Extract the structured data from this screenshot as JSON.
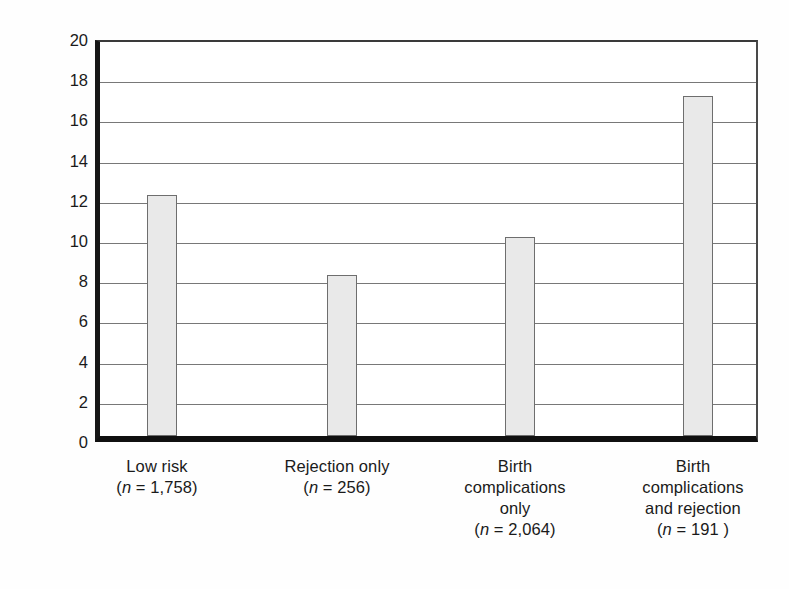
{
  "chart_data": {
    "type": "bar",
    "title": "",
    "subtitle": "",
    "xlabel": "",
    "ylabel": "Percent violent",
    "ylim": [
      0,
      20
    ],
    "ytick_step": 2,
    "yticks": [
      20,
      18,
      16,
      14,
      12,
      10,
      8,
      6,
      4,
      2,
      0
    ],
    "ytick_labels": [
      "20",
      "18",
      "16",
      "14",
      "12",
      "10",
      "8",
      "6",
      "4",
      "2",
      "0"
    ],
    "grid": "horizontal",
    "legend": "none",
    "categories": [
      "Low risk",
      "Rejection only",
      "Birth complications only",
      "Birth complications and rejection"
    ],
    "values": [
      12.0,
      8.0,
      9.9,
      16.9
    ],
    "group_sizes": [
      1758,
      256,
      2064,
      191
    ],
    "bar_color": "#e9e9e9",
    "bar_border_color": "#6e6e6e",
    "axis_color": "#101010",
    "gridline_color": "#787878",
    "background_color": "#ffffff"
  },
  "axis": {
    "y_title": "Percent violent",
    "ticks": [
      {
        "value": 20,
        "label": "20"
      },
      {
        "value": 18,
        "label": "18"
      },
      {
        "value": 16,
        "label": "16"
      },
      {
        "value": 14,
        "label": "14"
      },
      {
        "value": 12,
        "label": "12"
      },
      {
        "value": 10,
        "label": "10"
      },
      {
        "value": 8,
        "label": "8"
      },
      {
        "value": 6,
        "label": "6"
      },
      {
        "value": 4,
        "label": "4"
      },
      {
        "value": 2,
        "label": "2"
      },
      {
        "value": 0,
        "label": "0"
      }
    ]
  },
  "categories": [
    {
      "lines": [
        "Low risk"
      ],
      "n_prefix": "(",
      "n_italic": "n",
      "n_value": " = 1,758)",
      "value": 12.0
    },
    {
      "lines": [
        "Rejection only"
      ],
      "n_prefix": "(",
      "n_italic": "n",
      "n_value": " = 256)",
      "value": 8.0
    },
    {
      "lines": [
        "Birth",
        "complications",
        "only"
      ],
      "n_prefix": "(",
      "n_italic": "n",
      "n_value": " = 2,064)",
      "value": 9.9
    },
    {
      "lines": [
        "Birth",
        "complications",
        "and rejection"
      ],
      "n_prefix": "(",
      "n_italic": "n",
      "n_value": " = 191 )",
      "value": 16.9
    }
  ]
}
